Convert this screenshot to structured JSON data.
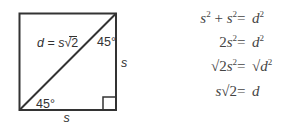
{
  "diagram": {
    "square": {
      "x": 19.5,
      "y": 13.5,
      "size": 96.5,
      "stroke": "#333333",
      "right_angle_marker": {
        "x": 103,
        "y": 97,
        "size": 13
      }
    },
    "labels": {
      "diagonal": {
        "var_d": "d",
        "equals": "=",
        "var_s": "s",
        "radical": "√",
        "radicand": "2"
      },
      "angle_top": "45°",
      "angle_bottom": "45°",
      "side_right": "s",
      "side_bottom": "s"
    },
    "equations": [
      {
        "lhs": [
          "s",
          "2",
          "+",
          "s",
          "2"
        ],
        "eq": "=",
        "rhs": [
          "d",
          "2"
        ]
      },
      {
        "lhs": [
          "2",
          "s",
          "2"
        ],
        "eq": "=",
        "rhs": [
          "d",
          "2"
        ]
      },
      {
        "lhs": [
          "√",
          "2",
          "s",
          "2"
        ],
        "eq": "=",
        "rhs": [
          "√",
          "d",
          "2"
        ]
      },
      {
        "lhs": [
          "s",
          "√",
          "2"
        ],
        "eq": "=",
        "rhs": [
          "d"
        ]
      }
    ],
    "colors": {
      "line": "#333333",
      "text": "#444444",
      "background": "#ffffff"
    }
  }
}
